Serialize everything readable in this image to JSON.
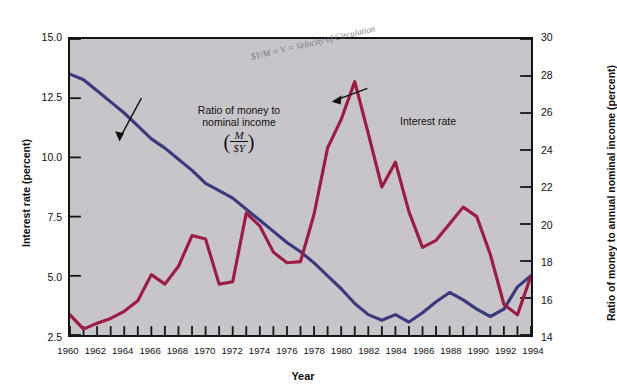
{
  "figure": {
    "background_color": "#ffffff",
    "plot_background_color": "#c8c5ca",
    "frame_color": "#141414"
  },
  "annotations": {
    "money_line_1": "Ratio of money to",
    "money_line_2": "nominal income",
    "money_frac_num": "M",
    "money_frac_den": "$Y",
    "money_paren_open": "(",
    "money_paren_close": ")",
    "interest_label": "Interest rate",
    "handwritten_note": "$Y/M = V = Velocity of Circulation"
  },
  "chart_data": {
    "type": "line",
    "title": "",
    "xlabel": "Year",
    "ylabel": "Interest rate (percent)",
    "ylabel_right": "Ratio of money to annual nominal income (percent)",
    "grid": false,
    "legend_position": "inline-annotations",
    "xlim": [
      1960,
      1994
    ],
    "ylim": [
      2.5,
      15.0
    ],
    "ylim_right": [
      14,
      30
    ],
    "xticks": [
      1960,
      1961,
      1962,
      1963,
      1964,
      1965,
      1966,
      1967,
      1968,
      1969,
      1970,
      1971,
      1972,
      1973,
      1974,
      1975,
      1976,
      1977,
      1978,
      1979,
      1980,
      1981,
      1982,
      1983,
      1984,
      1985,
      1986,
      1987,
      1988,
      1989,
      1990,
      1991,
      1992,
      1993,
      1994
    ],
    "xtick_labels": [
      "1960",
      "1962",
      "1964",
      "1966",
      "1968",
      "1970",
      "1972",
      "1974",
      "1976",
      "1978",
      "1980",
      "1982",
      "1984",
      "1986",
      "1988",
      "1990",
      "1992",
      "1994"
    ],
    "xtick_label_values": [
      1960,
      1962,
      1964,
      1966,
      1968,
      1970,
      1972,
      1974,
      1976,
      1978,
      1980,
      1982,
      1984,
      1986,
      1988,
      1990,
      1992,
      1994
    ],
    "ytick_labels_left": [
      "15.0",
      "12.5",
      "10.0",
      "7.5",
      "5.0",
      "2.5"
    ],
    "ytick_values_left": [
      15.0,
      12.5,
      10.0,
      7.5,
      5.0,
      2.5
    ],
    "ytick_labels_right": [
      "30",
      "28",
      "26",
      "24",
      "22",
      "20",
      "18",
      "16",
      "14"
    ],
    "ytick_values_right": [
      30,
      28,
      26,
      24,
      22,
      20,
      18,
      16,
      14
    ],
    "x": [
      1960,
      1961,
      1962,
      1963,
      1964,
      1965,
      1966,
      1967,
      1968,
      1969,
      1970,
      1971,
      1972,
      1973,
      1974,
      1975,
      1976,
      1977,
      1978,
      1979,
      1980,
      1981,
      1982,
      1983,
      1984,
      1985,
      1986,
      1987,
      1988,
      1989,
      1990,
      1991,
      1992,
      1993,
      1994
    ],
    "series": [
      {
        "name": "Interest rate",
        "axis": "left",
        "color": "#9c1c45",
        "units": "percent",
        "values": [
          3.35,
          2.75,
          3.0,
          3.2,
          3.5,
          3.95,
          5.05,
          4.65,
          5.4,
          6.7,
          6.55,
          4.65,
          4.75,
          7.65,
          7.1,
          6.0,
          5.55,
          5.6,
          7.6,
          10.4,
          11.6,
          13.2,
          11.0,
          8.75,
          9.8,
          7.7,
          6.2,
          6.5,
          7.2,
          7.9,
          7.5,
          5.9,
          3.8,
          3.35,
          5.0
        ]
      },
      {
        "name": "Ratio of money to nominal income (M/$Y)",
        "axis": "right",
        "color": "#3b3a7c",
        "units": "percent",
        "values": [
          28.1,
          27.8,
          27.2,
          26.6,
          26.0,
          25.3,
          24.6,
          24.1,
          23.5,
          22.9,
          22.2,
          21.8,
          21.4,
          20.8,
          20.2,
          19.6,
          19.0,
          18.5,
          17.9,
          17.2,
          16.5,
          15.7,
          15.1,
          14.8,
          15.1,
          14.7,
          15.2,
          15.8,
          16.3,
          15.9,
          15.4,
          15.0,
          15.4,
          16.6,
          17.2
        ]
      }
    ]
  }
}
